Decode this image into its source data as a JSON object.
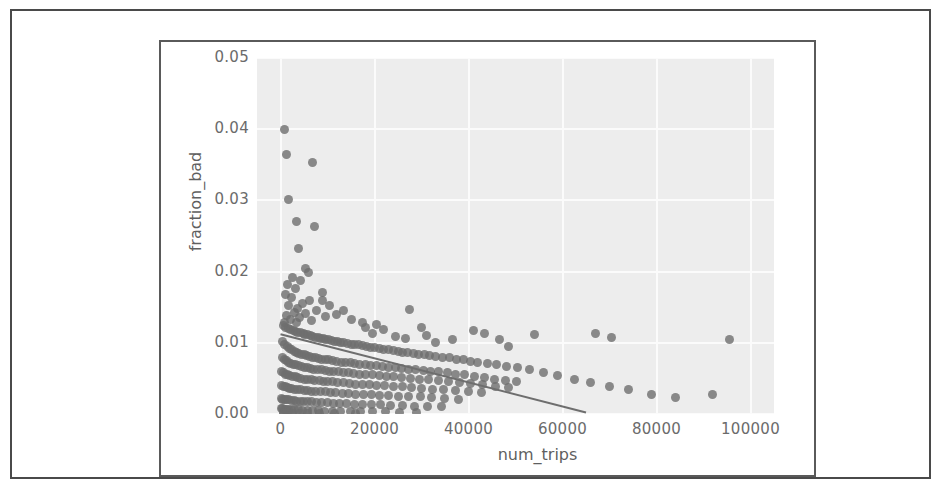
{
  "figure": {
    "xlabel": "num_trips",
    "ylabel": "fraction_bad"
  },
  "chart_data": {
    "type": "scatter",
    "title": "",
    "xlabel": "num_trips",
    "ylabel": "fraction_bad",
    "xlim": [
      -5000,
      105000
    ],
    "ylim": [
      0.0,
      0.05
    ],
    "xticks": [
      0,
      20000,
      40000,
      60000,
      80000,
      100000
    ],
    "xtick_labels": [
      "0",
      "20000",
      "40000",
      "60000",
      "80000",
      "100000"
    ],
    "yticks": [
      0.0,
      0.01,
      0.02,
      0.03,
      0.04,
      0.05
    ],
    "ytick_labels": [
      "0.00",
      "0.01",
      "0.02",
      "0.03",
      "0.04",
      "0.05"
    ],
    "grid": true,
    "grid_color": "#fbfbfb",
    "axes_facecolor": "#ededed",
    "legend": null,
    "marker_color": "#6e6e6e",
    "marker_alpha": 0.8,
    "marker_size": 9,
    "regression_line": {
      "color": "#6e6e6e",
      "x_start": 0,
      "y_start": 0.0112,
      "x_end": 65000,
      "y_end": 0.0002
    },
    "points": [
      [
        900,
        0.04
      ],
      [
        1200,
        0.0365
      ],
      [
        6800,
        0.0353
      ],
      [
        1700,
        0.0301
      ],
      [
        3400,
        0.0271
      ],
      [
        7300,
        0.0263
      ],
      [
        3800,
        0.0232
      ],
      [
        5300,
        0.0205
      ],
      [
        5900,
        0.0199
      ],
      [
        2600,
        0.0192
      ],
      [
        4200,
        0.0188
      ],
      [
        1500,
        0.0182
      ],
      [
        3100,
        0.0176
      ],
      [
        8900,
        0.0171
      ],
      [
        1000,
        0.0168
      ],
      [
        2300,
        0.0163
      ],
      [
        6100,
        0.0159
      ],
      [
        4600,
        0.0155
      ],
      [
        1800,
        0.0152
      ],
      [
        3600,
        0.0148
      ],
      [
        7700,
        0.0146
      ],
      [
        2900,
        0.0143
      ],
      [
        5400,
        0.0141
      ],
      [
        1300,
        0.0139
      ],
      [
        9500,
        0.0137
      ],
      [
        4000,
        0.0135
      ],
      [
        2100,
        0.0133
      ],
      [
        6600,
        0.0131
      ],
      [
        3300,
        0.0129
      ],
      [
        800,
        0.0128
      ],
      [
        12000,
        0.014
      ],
      [
        15000,
        0.0133
      ],
      [
        17500,
        0.0128
      ],
      [
        20500,
        0.0126
      ],
      [
        27500,
        0.0147
      ],
      [
        30000,
        0.0121
      ],
      [
        41000,
        0.0117
      ],
      [
        43500,
        0.0113
      ],
      [
        46500,
        0.0104
      ],
      [
        54000,
        0.0112
      ],
      [
        67000,
        0.0113
      ],
      [
        70500,
        0.0108
      ],
      [
        95500,
        0.0104
      ],
      [
        48500,
        0.0095
      ],
      [
        36500,
        0.0104
      ],
      [
        33000,
        0.01
      ],
      [
        600,
        0.0124
      ],
      [
        1100,
        0.0122
      ],
      [
        1600,
        0.012
      ],
      [
        2200,
        0.0118
      ],
      [
        2700,
        0.0117
      ],
      [
        3200,
        0.0116
      ],
      [
        3700,
        0.0115
      ],
      [
        4300,
        0.0114
      ],
      [
        4800,
        0.0113
      ],
      [
        5200,
        0.0112
      ],
      [
        5800,
        0.0111
      ],
      [
        6300,
        0.011
      ],
      [
        6900,
        0.0109
      ],
      [
        7400,
        0.0108
      ],
      [
        8000,
        0.0107
      ],
      [
        8500,
        0.0106
      ],
      [
        9100,
        0.0106
      ],
      [
        9600,
        0.0105
      ],
      [
        10200,
        0.0104
      ],
      [
        10800,
        0.0103
      ],
      [
        11400,
        0.0102
      ],
      [
        12100,
        0.0102
      ],
      [
        12800,
        0.0101
      ],
      [
        13500,
        0.01
      ],
      [
        14200,
        0.0099
      ],
      [
        15000,
        0.0098
      ],
      [
        15800,
        0.0097
      ],
      [
        16600,
        0.0097
      ],
      [
        17400,
        0.0096
      ],
      [
        18300,
        0.0095
      ],
      [
        19200,
        0.0094
      ],
      [
        20100,
        0.0093
      ],
      [
        21000,
        0.0092
      ],
      [
        22000,
        0.0091
      ],
      [
        23000,
        0.009
      ],
      [
        24000,
        0.0089
      ],
      [
        25000,
        0.0088
      ],
      [
        26000,
        0.0087
      ],
      [
        27000,
        0.0086
      ],
      [
        28200,
        0.0085
      ],
      [
        29400,
        0.0084
      ],
      [
        30600,
        0.0083
      ],
      [
        31800,
        0.0082
      ],
      [
        33000,
        0.0081
      ],
      [
        34500,
        0.008
      ],
      [
        36000,
        0.0079
      ],
      [
        37500,
        0.0077
      ],
      [
        39000,
        0.0076
      ],
      [
        40500,
        0.0074
      ],
      [
        42000,
        0.0073
      ],
      [
        44000,
        0.0071
      ],
      [
        46000,
        0.0069
      ],
      [
        48000,
        0.0067
      ],
      [
        50500,
        0.0065
      ],
      [
        53000,
        0.0062
      ],
      [
        56000,
        0.0058
      ],
      [
        59000,
        0.0054
      ],
      [
        62500,
        0.0049
      ],
      [
        66000,
        0.0044
      ],
      [
        70000,
        0.0039
      ],
      [
        74000,
        0.0034
      ],
      [
        79000,
        0.0028
      ],
      [
        84000,
        0.0023
      ],
      [
        92000,
        0.0028
      ],
      [
        500,
        0.0102
      ],
      [
        900,
        0.0098
      ],
      [
        1400,
        0.0095
      ],
      [
        1900,
        0.0092
      ],
      [
        2400,
        0.009
      ],
      [
        2900,
        0.0088
      ],
      [
        3400,
        0.0086
      ],
      [
        3900,
        0.0085
      ],
      [
        4400,
        0.0084
      ],
      [
        5000,
        0.0083
      ],
      [
        5600,
        0.0082
      ],
      [
        6200,
        0.0081
      ],
      [
        6800,
        0.008
      ],
      [
        7400,
        0.0079
      ],
      [
        8100,
        0.0078
      ],
      [
        8800,
        0.0077
      ],
      [
        9500,
        0.0076
      ],
      [
        10300,
        0.0076
      ],
      [
        11100,
        0.0075
      ],
      [
        12000,
        0.0074
      ],
      [
        12900,
        0.0073
      ],
      [
        13800,
        0.0072
      ],
      [
        14800,
        0.0072
      ],
      [
        15800,
        0.0071
      ],
      [
        16900,
        0.007
      ],
      [
        18000,
        0.0069
      ],
      [
        19200,
        0.0068
      ],
      [
        20400,
        0.0068
      ],
      [
        21700,
        0.0067
      ],
      [
        23000,
        0.0066
      ],
      [
        24400,
        0.0065
      ],
      [
        25800,
        0.0064
      ],
      [
        27300,
        0.0063
      ],
      [
        28800,
        0.0062
      ],
      [
        30400,
        0.0061
      ],
      [
        32000,
        0.006
      ],
      [
        33700,
        0.0059
      ],
      [
        35500,
        0.0058
      ],
      [
        37300,
        0.0056
      ],
      [
        39200,
        0.0055
      ],
      [
        41200,
        0.0053
      ],
      [
        43300,
        0.0051
      ],
      [
        45500,
        0.0049
      ],
      [
        47800,
        0.0047
      ],
      [
        50200,
        0.0045
      ],
      [
        400,
        0.008
      ],
      [
        800,
        0.0077
      ],
      [
        1200,
        0.0075
      ],
      [
        1700,
        0.0073
      ],
      [
        2200,
        0.0071
      ],
      [
        2700,
        0.007
      ],
      [
        3200,
        0.0069
      ],
      [
        3800,
        0.0068
      ],
      [
        4400,
        0.0067
      ],
      [
        5000,
        0.0066
      ],
      [
        5700,
        0.0065
      ],
      [
        6400,
        0.0064
      ],
      [
        7100,
        0.0063
      ],
      [
        7900,
        0.0062
      ],
      [
        8700,
        0.0062
      ],
      [
        9500,
        0.0061
      ],
      [
        10400,
        0.006
      ],
      [
        11300,
        0.006
      ],
      [
        12300,
        0.0059
      ],
      [
        13300,
        0.0058
      ],
      [
        14400,
        0.0058
      ],
      [
        15600,
        0.0057
      ],
      [
        16800,
        0.0056
      ],
      [
        18100,
        0.0056
      ],
      [
        19500,
        0.0055
      ],
      [
        21000,
        0.0054
      ],
      [
        22500,
        0.0053
      ],
      [
        24100,
        0.0052
      ],
      [
        25800,
        0.0051
      ],
      [
        27600,
        0.005
      ],
      [
        29500,
        0.0049
      ],
      [
        31500,
        0.0048
      ],
      [
        33600,
        0.0047
      ],
      [
        35800,
        0.0046
      ],
      [
        38100,
        0.0044
      ],
      [
        40500,
        0.0043
      ],
      [
        43000,
        0.0041
      ],
      [
        45700,
        0.0039
      ],
      [
        48500,
        0.0037
      ],
      [
        300,
        0.006
      ],
      [
        700,
        0.0058
      ],
      [
        1100,
        0.0056
      ],
      [
        1500,
        0.0055
      ],
      [
        2000,
        0.0054
      ],
      [
        2500,
        0.0053
      ],
      [
        3100,
        0.0052
      ],
      [
        3700,
        0.0051
      ],
      [
        4300,
        0.005
      ],
      [
        5000,
        0.0049
      ],
      [
        5700,
        0.0049
      ],
      [
        6500,
        0.0048
      ],
      [
        7300,
        0.0047
      ],
      [
        8200,
        0.0047
      ],
      [
        9100,
        0.0046
      ],
      [
        10100,
        0.0045
      ],
      [
        11100,
        0.0045
      ],
      [
        12200,
        0.0044
      ],
      [
        13400,
        0.0044
      ],
      [
        14700,
        0.0043
      ],
      [
        16000,
        0.0042
      ],
      [
        17400,
        0.0042
      ],
      [
        18900,
        0.0041
      ],
      [
        20500,
        0.004
      ],
      [
        22200,
        0.004
      ],
      [
        24000,
        0.0039
      ],
      [
        25900,
        0.0038
      ],
      [
        27900,
        0.0037
      ],
      [
        30000,
        0.0036
      ],
      [
        32300,
        0.0035
      ],
      [
        34700,
        0.0034
      ],
      [
        37200,
        0.0033
      ],
      [
        39900,
        0.0031
      ],
      [
        42700,
        0.003
      ],
      [
        250,
        0.004
      ],
      [
        600,
        0.0039
      ],
      [
        1000,
        0.0038
      ],
      [
        1400,
        0.0037
      ],
      [
        1900,
        0.0036
      ],
      [
        2400,
        0.0036
      ],
      [
        3000,
        0.0035
      ],
      [
        3600,
        0.0034
      ],
      [
        4300,
        0.0034
      ],
      [
        5000,
        0.0033
      ],
      [
        5800,
        0.0033
      ],
      [
        6600,
        0.0032
      ],
      [
        7500,
        0.0032
      ],
      [
        8500,
        0.0031
      ],
      [
        9500,
        0.0031
      ],
      [
        10600,
        0.003
      ],
      [
        11800,
        0.003
      ],
      [
        13100,
        0.0029
      ],
      [
        14500,
        0.0029
      ],
      [
        16000,
        0.0028
      ],
      [
        17600,
        0.0027
      ],
      [
        19300,
        0.0027
      ],
      [
        21100,
        0.0026
      ],
      [
        23000,
        0.0026
      ],
      [
        25100,
        0.0025
      ],
      [
        27300,
        0.0024
      ],
      [
        29700,
        0.0024
      ],
      [
        32200,
        0.0023
      ],
      [
        34900,
        0.0022
      ],
      [
        37800,
        0.0021
      ],
      [
        200,
        0.0022
      ],
      [
        500,
        0.0021
      ],
      [
        900,
        0.0021
      ],
      [
        1300,
        0.002
      ],
      [
        1800,
        0.002
      ],
      [
        2300,
        0.0019
      ],
      [
        2900,
        0.0019
      ],
      [
        3500,
        0.0018
      ],
      [
        4200,
        0.0018
      ],
      [
        4900,
        0.0018
      ],
      [
        5700,
        0.0017
      ],
      [
        6600,
        0.0017
      ],
      [
        7600,
        0.0016
      ],
      [
        8700,
        0.0016
      ],
      [
        9900,
        0.0016
      ],
      [
        11200,
        0.0015
      ],
      [
        12600,
        0.0015
      ],
      [
        14100,
        0.0015
      ],
      [
        15700,
        0.0014
      ],
      [
        17400,
        0.0014
      ],
      [
        19300,
        0.0013
      ],
      [
        21300,
        0.0013
      ],
      [
        23500,
        0.0012
      ],
      [
        25900,
        0.0012
      ],
      [
        28500,
        0.0011
      ],
      [
        31300,
        0.0011
      ],
      [
        34300,
        0.001
      ],
      [
        150,
        0.0008
      ],
      [
        450,
        0.0008
      ],
      [
        800,
        0.0007
      ],
      [
        1200,
        0.0007
      ],
      [
        1700,
        0.0007
      ],
      [
        2300,
        0.0006
      ],
      [
        3000,
        0.0006
      ],
      [
        3800,
        0.0006
      ],
      [
        4700,
        0.0005
      ],
      [
        5700,
        0.0005
      ],
      [
        6800,
        0.0005
      ],
      [
        8000,
        0.0005
      ],
      [
        9400,
        0.0004
      ],
      [
        11000,
        0.0004
      ],
      [
        12800,
        0.0004
      ],
      [
        14800,
        0.0004
      ],
      [
        17000,
        0.0003
      ],
      [
        19500,
        0.0003
      ],
      [
        22300,
        0.0003
      ],
      [
        25400,
        0.0002
      ],
      [
        28900,
        0.0002
      ],
      [
        700,
        0.0002
      ],
      [
        1500,
        0.0002
      ],
      [
        2600,
        0.0001
      ],
      [
        4000,
        0.0001
      ],
      [
        5800,
        0.0001
      ],
      [
        8200,
        0.0001
      ],
      [
        11500,
        0.0001
      ],
      [
        16000,
        0.0001
      ],
      [
        600,
        0.0
      ],
      [
        31000,
        0.011
      ],
      [
        22000,
        0.0118
      ],
      [
        18000,
        0.0122
      ],
      [
        10500,
        0.0152
      ],
      [
        13500,
        0.0146
      ],
      [
        9000,
        0.016
      ],
      [
        24500,
        0.0109
      ],
      [
        26500,
        0.0106
      ],
      [
        19500,
        0.0113
      ]
    ]
  }
}
